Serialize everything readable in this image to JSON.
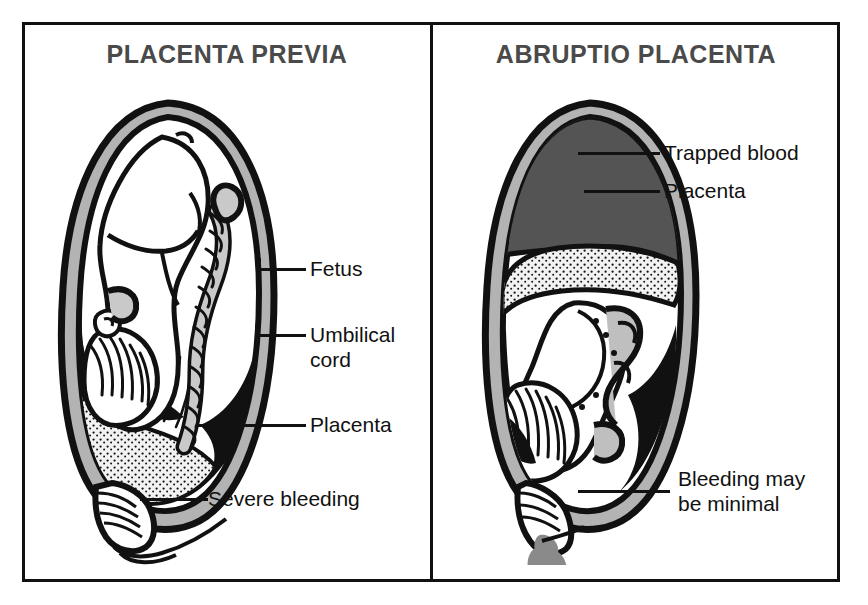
{
  "figure": {
    "kind": "medical-illustration",
    "topic": "Comparison of placenta previa and abruptio placenta",
    "border_color": "#111111",
    "background": "#ffffff"
  },
  "panels": [
    {
      "id": "placenta-previa",
      "title": "PLACENTA PREVIA",
      "title_color": "#4a4a4a",
      "labels": [
        {
          "id": "fetus",
          "text": "Fetus"
        },
        {
          "id": "umbilical-cord",
          "text": "Umbilical\ncord"
        },
        {
          "id": "placenta",
          "text": "Placenta"
        },
        {
          "id": "severe-bleeding",
          "text": "Severe bleeding"
        }
      ]
    },
    {
      "id": "abruptio-placenta",
      "title": "ABRUPTIO PLACENTA",
      "title_color": "#4a4a4a",
      "labels": [
        {
          "id": "trapped-blood",
          "text": "Trapped blood"
        },
        {
          "id": "placenta",
          "text": "Placenta"
        },
        {
          "id": "bleeding-minimal",
          "text": "Bleeding may\nbe minimal"
        }
      ]
    }
  ],
  "colors": {
    "ink": "#111111",
    "uterine_wall_gray": "#b3b3b3",
    "trapped_blood_gray": "#545454",
    "placenta_stipple_gray": "#e8e8e8",
    "blood_drop_gray": "#8a8a8a",
    "title_gray": "#4a4a4a",
    "paper": "#ffffff"
  }
}
